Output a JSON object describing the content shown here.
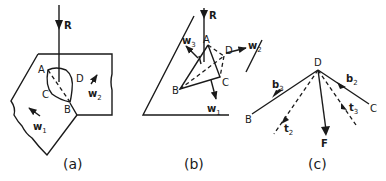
{
  "figure": {
    "panels": [
      {
        "caption": "(a)",
        "labels": {
          "force": "R",
          "A": "A",
          "B": "B",
          "C": "C",
          "D": "D"
        },
        "vectors": [
          {
            "name": "w",
            "sub": "1"
          },
          {
            "name": "w",
            "sub": "2"
          }
        ]
      },
      {
        "caption": "(b)",
        "labels": {
          "force": "R",
          "A": "A",
          "B": "B",
          "C": "C",
          "D": "D"
        },
        "vectors": [
          {
            "name": "w",
            "sub": "1"
          },
          {
            "name": "w",
            "sub": "2"
          },
          {
            "name": "w",
            "sub": "3"
          }
        ]
      },
      {
        "caption": "(c)",
        "labels": {
          "D": "D",
          "B": "B",
          "C": "C",
          "F": "F"
        },
        "vectors": [
          {
            "name": "b",
            "sub": "2"
          },
          {
            "name": "b",
            "sub": "3"
          },
          {
            "name": "t",
            "sub": "2"
          },
          {
            "name": "t",
            "sub": "3"
          }
        ]
      }
    ],
    "colors": {
      "ink": "#1a1a1a",
      "background": "#ffffff"
    }
  }
}
